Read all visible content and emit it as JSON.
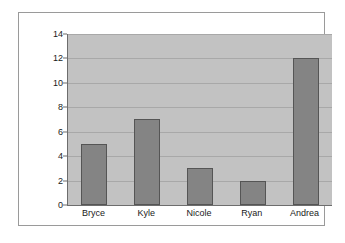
{
  "chart_data": {
    "type": "bar",
    "title": "",
    "subtitle": "",
    "xlabel": "",
    "ylabel": "",
    "categories": [
      "Bryce",
      "Kyle",
      "Nicole",
      "Ryan",
      "Andrea"
    ],
    "values": [
      5,
      7,
      3,
      2,
      12
    ],
    "series": [
      {
        "name": "",
        "values": [
          5,
          7,
          3,
          2,
          12
        ]
      }
    ],
    "ylim": [
      0,
      14
    ],
    "ytick_labels": [
      "14",
      "12",
      "10",
      "8",
      "6",
      "4",
      "2",
      "0"
    ],
    "ytick_values": [
      14,
      12,
      10,
      8,
      6,
      4,
      2,
      0
    ],
    "ytick_interval": 2,
    "grid": true,
    "grid_axis": "y",
    "legend": false,
    "legend_position": "none",
    "annotations": [],
    "colors": {
      "bar_fill": "#848484",
      "bar_border": "#555555",
      "plot_background": "#c2c2c2",
      "gridline": "#a8a8a8",
      "axis_line": "#6d6d6d",
      "figure_border": "#9a9a9a",
      "figure_background": "#ffffff",
      "tick_label": "#1a1a1a"
    }
  }
}
